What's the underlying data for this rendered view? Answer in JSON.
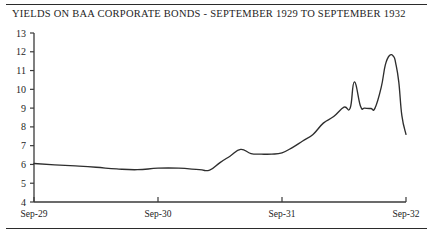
{
  "document": {
    "title_text": "YIELDS ON BAA CORPORATE BONDS - SEPTEMBER 1929 TO SEPTEMBER 1932",
    "rule_top_name": "top-divider",
    "rule_bottom_name": "bottom-divider"
  },
  "chart_data": {
    "type": "line",
    "title": "YIELDS ON BAA CORPORATE BONDS - SEPTEMBER 1929 TO SEPTEMBER 1932",
    "xlabel": "",
    "ylabel": "",
    "ylim": [
      4,
      13
    ],
    "xlim": [
      0,
      36
    ],
    "grid": false,
    "legend": "none",
    "yticks": [
      4,
      5,
      6,
      7,
      8,
      9,
      10,
      11,
      12,
      13
    ],
    "ytick_labels": [
      "4",
      "5",
      "6",
      "7",
      "8",
      "9",
      "10",
      "11",
      "12",
      "13"
    ],
    "xticks": [
      0,
      12,
      24,
      36
    ],
    "xtick_labels": [
      "Sep-29",
      "Sep-30",
      "Sep-31",
      "Sep-32"
    ],
    "series": [
      {
        "name": "Baa corporate bond yield",
        "x": [
          0,
          1,
          2,
          3,
          4,
          5,
          6,
          7,
          8,
          9,
          10,
          11,
          12,
          13,
          14,
          15,
          16,
          17,
          18,
          19,
          20,
          21,
          22,
          23,
          24,
          25,
          26,
          27,
          28,
          29,
          30,
          31,
          32,
          33,
          34,
          35,
          36
        ],
        "values": [
          6.05,
          6.0,
          5.98,
          5.95,
          5.92,
          5.9,
          5.85,
          5.8,
          5.75,
          5.72,
          5.72,
          5.75,
          5.8,
          5.82,
          5.8,
          5.75,
          5.72,
          5.95,
          6.3,
          6.5,
          6.8,
          6.6,
          6.55,
          6.58,
          6.7,
          6.95,
          7.3,
          7.7,
          8.2,
          8.6,
          9.1,
          9.0,
          10.4,
          9.0,
          8.95,
          9.0,
          9.0
        ],
        "x_note": "monthly index from Sep-1929 (0) to Sep-1932 (36)"
      }
    ],
    "series_detail_points": [
      [
        0,
        6.05
      ],
      [
        2,
        5.98
      ],
      [
        4,
        5.92
      ],
      [
        6,
        5.85
      ],
      [
        8,
        5.76
      ],
      [
        10,
        5.72
      ],
      [
        12,
        5.8
      ],
      [
        14,
        5.8
      ],
      [
        16,
        5.72
      ],
      [
        17,
        5.7
      ],
      [
        18,
        6.1
      ],
      [
        19,
        6.45
      ],
      [
        20,
        6.8
      ],
      [
        21,
        6.58
      ],
      [
        22,
        6.55
      ],
      [
        23,
        6.55
      ],
      [
        24,
        6.62
      ],
      [
        25,
        6.9
      ],
      [
        26,
        7.25
      ],
      [
        27,
        7.6
      ],
      [
        28,
        8.2
      ],
      [
        29,
        8.55
      ],
      [
        30,
        9.05
      ],
      [
        30.6,
        9.0
      ],
      [
        31,
        10.4
      ],
      [
        31.6,
        9.1
      ],
      [
        32,
        9.0
      ],
      [
        32.6,
        8.98
      ],
      [
        33,
        9.0
      ],
      [
        33.6,
        10.1
      ],
      [
        34,
        11.3
      ],
      [
        34.4,
        11.8
      ],
      [
        34.8,
        11.75
      ],
      [
        35,
        11.4
      ],
      [
        35.3,
        10.4
      ],
      [
        35.6,
        8.6
      ],
      [
        36,
        7.6
      ]
    ],
    "annotations": [],
    "peak_value": 11.8,
    "trough_value": 5.7,
    "start_value": 6.05,
    "end_value": 7.6
  }
}
